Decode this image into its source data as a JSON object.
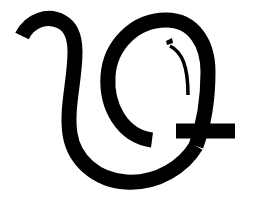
{
  "image": {
    "kind": "glyph-artwork",
    "description": "Stylized calligraphic letterform glyph",
    "width": 253,
    "height": 203,
    "background_color": "#ffffff",
    "ink_color": "#000000"
  },
  "glyph": {
    "name": "curved-letterform-glyph",
    "stroke_color": "#000000",
    "stroke_width_main": 15,
    "stroke_width_thin": 3.5,
    "stroke_linecap": "butt",
    "parts": [
      {
        "name": "left-hook-and-stem",
        "role": "opening hook descending into the left stem and bottom bowl",
        "path": "M 22 36 C 30 20 48 14 62 22 C 73 28 75 40 75 52 C 75 80 66 108 70 134 C 74 160 96 180 126 182 C 158 184 184 166 196 146"
      },
      {
        "name": "outer-loop",
        "role": "large oval loop at upper right",
        "path": "M 152 140 C 122 136 106 106 108 76 C 110 46 134 20 166 20 C 194 20 208 44 208 72 C 208 100 204 124 196 146"
      },
      {
        "name": "right-tail",
        "role": "horizontal tail extending to the right edge",
        "path": "M 176 131 L 235 131"
      },
      {
        "name": "inner-thin-arc",
        "role": "thin decorative arc inside the loop",
        "path": "M 170 46 C 182 52 188 66 188 95"
      },
      {
        "name": "inner-dot",
        "role": "small tick mark at top of the inner arc",
        "path": "M 166 41 L 172 38 L 173 43 L 167 45 Z"
      }
    ]
  }
}
